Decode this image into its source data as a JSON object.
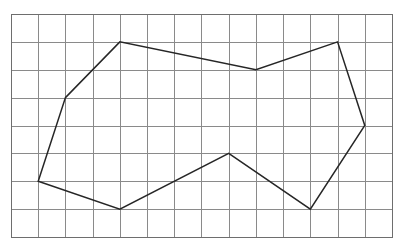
{
  "figure": {
    "background_color": "#ffffff"
  },
  "chart_data": {
    "type": "scatter",
    "subtitle": "",
    "xlabel": "",
    "ylabel": "",
    "grid": true,
    "legend_position": "none",
    "axis_ticks_visible": false,
    "tick_labels_x": [],
    "tick_labels_y": [],
    "grid_columns": 14,
    "grid_rows": 8,
    "xlim": [
      0,
      14
    ],
    "ylim": [
      0,
      8
    ],
    "grid_geometry": {
      "origin_x_px": 11,
      "origin_y_px": 14,
      "cell_width_px": 27.214,
      "cell_height_px": 27.875,
      "grid_line_color": "#8a8a8a",
      "grid_border_color": "#6e6e6e"
    },
    "series": [
      {
        "name": "polygon-outline",
        "closed": true,
        "stroke_color": "#262626",
        "stroke_width": 1.5,
        "fill": "none",
        "vertex_count": 9,
        "vertices_grid": [
          [
            2,
            3
          ],
          [
            4,
            1
          ],
          [
            9,
            2
          ],
          [
            12,
            1
          ],
          [
            13,
            4
          ],
          [
            11,
            7
          ],
          [
            8,
            5
          ],
          [
            4,
            7
          ],
          [
            1,
            6
          ]
        ],
        "vertices_px": [
          [
            65.4,
            97.6
          ],
          [
            119.9,
            41.9
          ],
          [
            256.0,
            69.8
          ],
          [
            337.6,
            41.9
          ],
          [
            364.8,
            125.5
          ],
          [
            310.4,
            209.1
          ],
          [
            228.7,
            153.4
          ],
          [
            119.9,
            209.1
          ],
          [
            38.2,
            181.3
          ]
        ]
      }
    ],
    "annotations": []
  }
}
